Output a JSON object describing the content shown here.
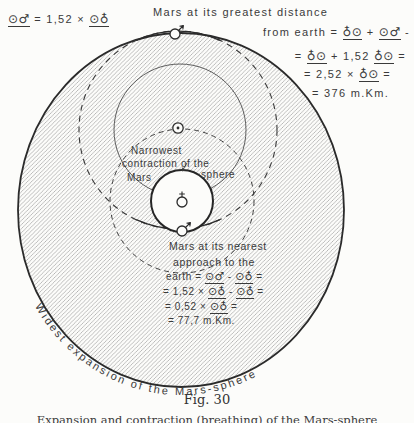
{
  "page": {
    "background": "#fcfcfa",
    "ink": "#2e2e2e",
    "hatch_color": "#8a8a8a"
  },
  "figure": {
    "top_left_formula": [
      {
        "t": "⊙♂",
        "u": true,
        "s": true
      },
      {
        "t": " = 1,52 × "
      },
      {
        "t": "⊙♁",
        "u": true,
        "s": true
      }
    ],
    "greatest": {
      "title": "Mars at its greatest distance",
      "lines": [
        [
          {
            "t": "from earth = "
          },
          {
            "t": "♁⊙",
            "u": true,
            "s": true
          },
          {
            "t": " + "
          },
          {
            "t": "⊙♂",
            "u": true,
            "s": true
          },
          {
            "t": " -"
          }
        ],
        [
          {
            "t": "= "
          },
          {
            "t": "♁⊙",
            "u": true,
            "s": true
          },
          {
            "t": " + 1,52 "
          },
          {
            "t": "♁⊙",
            "u": true,
            "s": true
          },
          {
            "t": " ="
          }
        ],
        [
          {
            "t": "= 2,52 × "
          },
          {
            "t": "♁⊙",
            "u": true,
            "s": true
          },
          {
            "t": " ="
          }
        ],
        [
          {
            "t": "= 376 m.Km."
          }
        ]
      ]
    },
    "narrowest": {
      "l1": "Narrowest",
      "l2": "contraction of the",
      "l3": "Mars",
      "l4": "sphere"
    },
    "nearest": {
      "l1": "Mars at its nearest",
      "l2": "approach to the",
      "lines": [
        [
          {
            "t": "earth = "
          },
          {
            "t": "⊙♂",
            "u": true,
            "s": true
          },
          {
            "t": " - "
          },
          {
            "t": "⊙♁",
            "u": true,
            "s": true
          },
          {
            "t": " ="
          }
        ],
        [
          {
            "t": "= 1,52 × "
          },
          {
            "t": "⊙♁",
            "u": true,
            "s": true
          },
          {
            "t": " - "
          },
          {
            "t": "⊙♁",
            "u": true,
            "s": true
          },
          {
            "t": " ="
          }
        ],
        [
          {
            "t": "= 0,52 × "
          },
          {
            "t": "⊙♁",
            "u": true,
            "s": true
          },
          {
            "t": " ="
          }
        ],
        [
          {
            "t": "= 77,7 m.Km."
          }
        ]
      ]
    },
    "widest_label": "Widest expansion of the Mars-sphere",
    "caption_fig": "Fig. 30",
    "caption_sub": "Expansion and contraction (breathing) of the Mars-sphere",
    "glyphs": {
      "sun-icon": "⊙",
      "mars-icon": "♂",
      "earth-icon": "♁"
    }
  }
}
